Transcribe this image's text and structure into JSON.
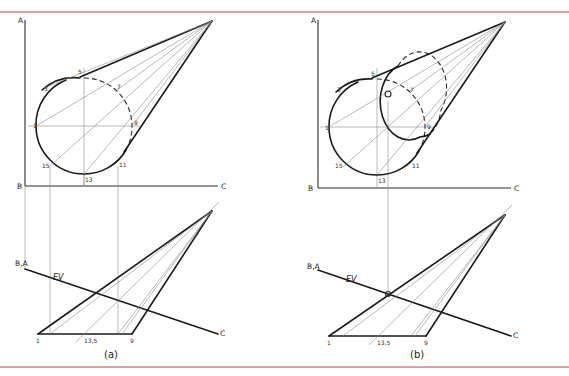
{
  "figure": {
    "rule_color": "#c0394f",
    "panels": [
      {
        "caption": "(a)",
        "frontal_view": {
          "axis_labels": {
            "a": "A",
            "b": "B",
            "c": "C"
          },
          "point_labels": {
            "p1": "1",
            "p3": "3",
            "p5": "5",
            "p7": "7",
            "p9": "9",
            "p11": "11",
            "p13": "13",
            "p15": "15"
          }
        },
        "edge_view": {
          "axis_labels": {
            "ba": "B,A",
            "c": "C"
          },
          "ev_label": "EV",
          "point_labels": {
            "p1": "1",
            "p135": "13,5",
            "p9": "9"
          }
        }
      },
      {
        "caption": "(b)",
        "frontal_view": {
          "axis_labels": {
            "a": "A",
            "b": "B",
            "c": "C"
          },
          "point_labels": {
            "p1": "1",
            "p3": "3",
            "p5": "5",
            "p7": "7",
            "p9": "9",
            "p11": "11",
            "p13": "13",
            "p15": "15",
            "o": "O"
          }
        },
        "edge_view": {
          "axis_labels": {
            "ba": "B,A",
            "c": "C"
          },
          "ev_label": "EV",
          "point_labels": {
            "p1": "1",
            "p135": "13,5",
            "p9": "9"
          }
        }
      }
    ]
  }
}
